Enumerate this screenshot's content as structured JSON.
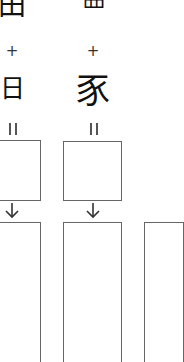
{
  "diagram": {
    "type": "character-composition",
    "columns": [
      {
        "top_component": "田",
        "operator": "+",
        "bottom_component": "日",
        "result_marker": "="
      },
      {
        "top_component": "罒",
        "operator": "+",
        "bottom_component": "豕",
        "result_marker": "="
      }
    ],
    "colors": {
      "ink": "#111111",
      "box_border": "#666666",
      "background": "#ffffff"
    }
  }
}
